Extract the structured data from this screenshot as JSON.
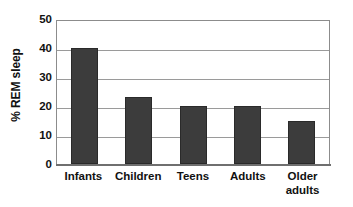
{
  "chart_data": {
    "type": "bar",
    "title": "",
    "xlabel": "",
    "ylabel": "% REM sleep",
    "categories": [
      "Infants",
      "Children",
      "Teens",
      "Adults",
      "Older\nadults"
    ],
    "values": [
      40,
      23,
      20,
      20,
      15
    ],
    "ylim": [
      0,
      50
    ],
    "yticks": [
      0,
      10,
      20,
      30,
      40,
      50
    ],
    "ytick_labels": [
      "0",
      "10",
      "20",
      "30",
      "40",
      "50"
    ],
    "grid": true,
    "legend": false,
    "legend_position": "none",
    "bar_color": "#3c3c3c",
    "grid_color": "#9a9a9a",
    "frame_color": "#8c8c8c",
    "background_color": "#ffffff",
    "text_color": "#111111"
  }
}
